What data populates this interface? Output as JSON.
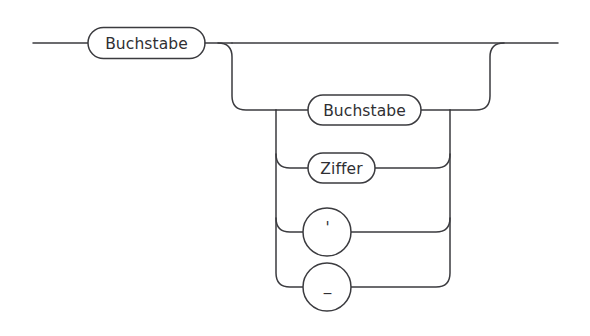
{
  "diagram": {
    "type": "railroad-syntax-diagram",
    "language": "de",
    "background_color": "#ffffff",
    "line_color": "#3b3b3f",
    "text_color": "#2f2f33",
    "nodes": [
      {
        "id": "first-buchstabe",
        "label": "Buchstabe",
        "shape": "stadium",
        "x": 146,
        "y": 43,
        "width": 117,
        "height": 31
      },
      {
        "id": "loop-buchstabe",
        "label": "Buchstabe",
        "shape": "stadium",
        "x": 364,
        "y": 110,
        "width": 113,
        "height": 30
      },
      {
        "id": "loop-ziffer",
        "label": "Ziffer",
        "shape": "stadium",
        "x": 341,
        "y": 168,
        "width": 67,
        "height": 30
      },
      {
        "id": "loop-apostrophe",
        "label": "'",
        "shape": "circle",
        "x": 327,
        "y": 232,
        "radius": 24
      },
      {
        "id": "loop-underscore",
        "label": "_",
        "shape": "circle",
        "x": 327,
        "y": 287,
        "radius": 24
      }
    ],
    "entry_line": {
      "x_start": 33,
      "x_end": 88,
      "y": 43
    },
    "exit_line": {
      "x_start": 490,
      "x_end": 558,
      "y": 43
    },
    "rails": {
      "main_y": 43,
      "loop_left_x": 232,
      "loop_right_x": 490,
      "branch_left_x": 276,
      "branch_right_x": 450,
      "branch_rows_y": [
        110,
        168,
        232,
        287
      ],
      "corner_radius": 14
    }
  }
}
